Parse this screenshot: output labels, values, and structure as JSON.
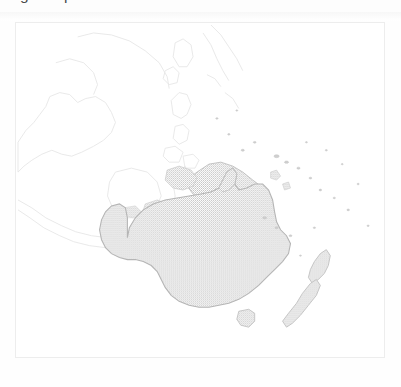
{
  "header": {
    "checkbox_icon": "checkbox-unchecked-icon",
    "checkbox_checked": false,
    "text": "game production"
  },
  "map_panel": {
    "title": "",
    "region": "Oceania",
    "border_color": "#ededed",
    "background_color": "#ffffff",
    "fill_color": "#c9c9c9",
    "outline_color": "#b8b8b8",
    "faint_outline_color": "#e8e8e8",
    "highlighted_regions": [
      "Australia",
      "Tasmania",
      "Papua New Guinea",
      "New Zealand"
    ],
    "faint_regions": [
      "Indonesia",
      "Philippines",
      "Malaysia",
      "Indochina",
      "Japan",
      "Pacific Islands"
    ]
  }
}
